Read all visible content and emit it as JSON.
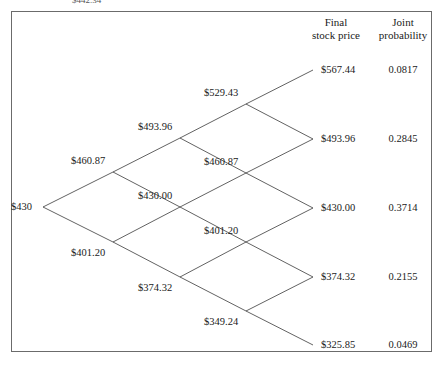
{
  "figure": {
    "clipped_caption": "$442.34",
    "type": "binomial-lattice",
    "root_label": "$430"
  },
  "columns": {
    "final_price_header_line1": "Final",
    "final_price_header_line2": "stock price",
    "joint_prob_header_line1": "Joint",
    "joint_prob_header_line2": "probability"
  },
  "chart_data": {
    "type": "diagram",
    "title": "",
    "subtitle": "",
    "xlabel": "",
    "ylabel": "",
    "grid": false,
    "legend": "none",
    "steps": 4,
    "root_value": "$430",
    "nodes": [
      {
        "step": 0,
        "level": 0,
        "label": "$430",
        "x": 43,
        "y": 207,
        "anchor": "left"
      },
      {
        "step": 1,
        "level": 1,
        "label": "$460.87",
        "x": 113,
        "y": 172,
        "anchor": "above"
      },
      {
        "step": 1,
        "level": 0,
        "label": "$401.20",
        "x": 113,
        "y": 242,
        "anchor": "below"
      },
      {
        "step": 2,
        "level": 2,
        "label": "$493.96",
        "x": 180,
        "y": 138,
        "anchor": "above"
      },
      {
        "step": 2,
        "level": 1,
        "label": "$430.00",
        "x": 180,
        "y": 207,
        "anchor": "above"
      },
      {
        "step": 2,
        "level": 0,
        "label": "$374.32",
        "x": 180,
        "y": 277,
        "anchor": "below"
      },
      {
        "step": 3,
        "level": 3,
        "label": "$529.43",
        "x": 246,
        "y": 104,
        "anchor": "above"
      },
      {
        "step": 3,
        "level": 2,
        "label": "$460.87",
        "x": 246,
        "y": 173,
        "anchor": "above"
      },
      {
        "step": 3,
        "level": 1,
        "label": "$401.20",
        "x": 246,
        "y": 242,
        "anchor": "above"
      },
      {
        "step": 3,
        "level": 0,
        "label": "$349.24",
        "x": 246,
        "y": 311,
        "anchor": "below"
      }
    ],
    "terminal": [
      {
        "level": 4,
        "price": "$567.44",
        "probability": "0.0817",
        "x": 313,
        "y": 70
      },
      {
        "level": 3,
        "price": "$493.96",
        "probability": "0.2845",
        "x": 313,
        "y": 139
      },
      {
        "level": 2,
        "price": "$430.00",
        "probability": "0.3714",
        "x": 313,
        "y": 208
      },
      {
        "level": 1,
        "price": "$374.32",
        "probability": "0.2155",
        "x": 313,
        "y": 277
      },
      {
        "level": 0,
        "price": "$325.85",
        "probability": "0.0469",
        "x": 313,
        "y": 345
      }
    ],
    "edges": [
      [
        43,
        207,
        113,
        172
      ],
      [
        43,
        207,
        113,
        242
      ],
      [
        113,
        172,
        180,
        138
      ],
      [
        113,
        172,
        180,
        207
      ],
      [
        113,
        242,
        180,
        207
      ],
      [
        113,
        242,
        180,
        277
      ],
      [
        180,
        138,
        246,
        104
      ],
      [
        180,
        138,
        246,
        173
      ],
      [
        180,
        207,
        246,
        173
      ],
      [
        180,
        207,
        246,
        242
      ],
      [
        180,
        277,
        246,
        242
      ],
      [
        180,
        277,
        246,
        311
      ],
      [
        246,
        104,
        313,
        70
      ],
      [
        246,
        104,
        313,
        139
      ],
      [
        246,
        173,
        313,
        139
      ],
      [
        246,
        173,
        313,
        208
      ],
      [
        246,
        242,
        313,
        208
      ],
      [
        246,
        242,
        313,
        277
      ],
      [
        246,
        311,
        313,
        277
      ],
      [
        246,
        311,
        313,
        345
      ]
    ]
  },
  "colors": {
    "line": "#3a3a3a",
    "border": "#6b6b6b",
    "text": "#1a1a1a",
    "background": "#ffffff"
  }
}
